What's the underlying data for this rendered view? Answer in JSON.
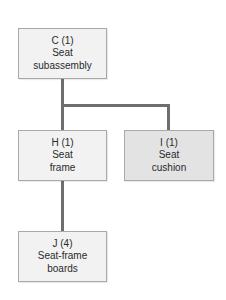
{
  "diagram": {
    "type": "product-structure-tree",
    "nodes": [
      {
        "id": "C",
        "code": "C (1)",
        "line1": "Seat",
        "line2": "subassembly",
        "quantity": 1,
        "shaded": false
      },
      {
        "id": "H",
        "code": "H (1)",
        "line1": "Seat",
        "line2": "frame",
        "quantity": 1,
        "shaded": false
      },
      {
        "id": "I",
        "code": "I (1)",
        "line1": "Seat",
        "line2": "cushion",
        "quantity": 1,
        "shaded": true
      },
      {
        "id": "J",
        "code": "J (4)",
        "line1": "Seat-frame",
        "line2": "boards",
        "quantity": 4,
        "shaded": false
      }
    ],
    "edges": [
      {
        "from": "C",
        "to": "H"
      },
      {
        "from": "C",
        "to": "I"
      },
      {
        "from": "H",
        "to": "J"
      }
    ],
    "colors": {
      "node_fill": "#f2f2f2",
      "node_fill_shaded": "#e3e3e3",
      "node_border": "#a9a9a9",
      "connector": "#6e6e6e",
      "text": "#2a2a2a"
    }
  }
}
